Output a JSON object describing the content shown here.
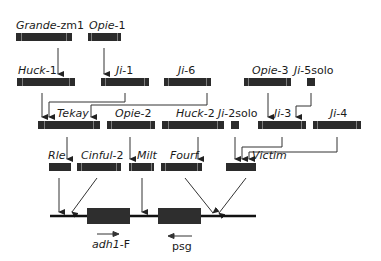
{
  "diagram": {
    "type": "transposon nesting / insertion history",
    "colors": {
      "element_box": "#2b2b2b",
      "lines": "#333333",
      "background": "#ffffff"
    },
    "rows": [
      {
        "level": 1,
        "elements": [
          {
            "id": "grande",
            "name_italic": "Grande",
            "name_suffix": "-zm1",
            "x": 16,
            "y": 33,
            "w": 56
          },
          {
            "id": "opie1",
            "name_italic": "Opie",
            "name_suffix": "-1",
            "x": 88,
            "y": 33,
            "w": 33
          }
        ]
      },
      {
        "level": 2,
        "elements": [
          {
            "id": "huck1",
            "name_italic": "Huck",
            "name_suffix": "-1",
            "x": 17,
            "y": 78,
            "w": 58
          },
          {
            "id": "ji1",
            "name_italic": "Ji",
            "name_suffix": "-1",
            "x": 101,
            "y": 78,
            "w": 48
          },
          {
            "id": "ji6",
            "name_italic": "Ji",
            "name_suffix": "-6",
            "x": 164,
            "y": 78,
            "w": 47
          },
          {
            "id": "opie3",
            "name_italic": "Opie",
            "name_suffix": "-3",
            "x": 244,
            "y": 78,
            "w": 47
          },
          {
            "id": "ji5solo",
            "name_italic": "Ji",
            "name_suffix": "-5solo",
            "x": 307,
            "y": 78,
            "w": 8,
            "solo": true
          }
        ]
      },
      {
        "level": 3,
        "elements": [
          {
            "id": "tekay",
            "name_italic": "Tekay",
            "name_suffix": "",
            "x": 38,
            "y": 121,
            "w": 62
          },
          {
            "id": "opie2",
            "name_italic": "Opie",
            "name_suffix": "-2",
            "x": 107,
            "y": 121,
            "w": 48
          },
          {
            "id": "huck2",
            "name_italic": "Huck",
            "name_suffix": "-2",
            "x": 162,
            "y": 121,
            "w": 62
          },
          {
            "id": "ji2solo",
            "name_italic": "Ji",
            "name_suffix": "-2solo",
            "x": 231,
            "y": 121,
            "w": 8,
            "solo": true
          },
          {
            "id": "ji3",
            "name_italic": "Ji",
            "name_suffix": "-3",
            "x": 258,
            "y": 121,
            "w": 48
          },
          {
            "id": "ji4",
            "name_italic": "Ji",
            "name_suffix": "-4",
            "x": 313,
            "y": 121,
            "w": 48
          }
        ]
      },
      {
        "level": 4,
        "elements": [
          {
            "id": "rle",
            "name_italic": "Rle",
            "name_suffix": "",
            "x": 49,
            "y": 163,
            "w": 22
          },
          {
            "id": "cinful2",
            "name_italic": "Cinful",
            "name_suffix": "-2",
            "x": 77,
            "y": 163,
            "w": 44
          },
          {
            "id": "milt",
            "name_italic": "Milt",
            "name_suffix": "",
            "x": 129,
            "y": 163,
            "w": 25
          },
          {
            "id": "fourf",
            "name_italic": "Fourf",
            "name_suffix": "",
            "x": 161,
            "y": 163,
            "w": 41
          },
          {
            "id": "victim",
            "name_italic": "Victim",
            "name_suffix": "",
            "x": 226,
            "y": 163,
            "w": 30
          }
        ]
      }
    ],
    "locus": {
      "line": {
        "x1": 50,
        "x2": 256,
        "y": 216
      },
      "genes": [
        {
          "id": "adh1f",
          "label_italic": "adh1",
          "label_suffix": "-F",
          "x": 87,
          "w": 43,
          "direction": "right"
        },
        {
          "id": "psg",
          "label_italic": "",
          "label_suffix": "psg",
          "x": 158,
          "w": 43,
          "direction": "left"
        }
      ]
    },
    "insertions": [
      {
        "from": "grande",
        "into": "huck1"
      },
      {
        "from": "opie1",
        "into": "ji1"
      },
      {
        "from": "huck1",
        "into": "tekay"
      },
      {
        "from": "ji1",
        "into": "tekay"
      },
      {
        "from": "ji6",
        "into": "tekay"
      },
      {
        "from": "opie3",
        "into": "ji3"
      },
      {
        "from": "ji5solo",
        "into": "ji3"
      },
      {
        "from": "tekay",
        "into": "rle"
      },
      {
        "from": "opie2",
        "into": "milt"
      },
      {
        "from": "huck2",
        "into": "fourf"
      },
      {
        "from": "ji2solo",
        "into": "victim"
      },
      {
        "from": "ji3",
        "into": "victim"
      },
      {
        "from": "ji4",
        "into": "victim"
      },
      {
        "from": "rle",
        "into": "locus"
      },
      {
        "from": "cinful2",
        "into": "locus"
      },
      {
        "from": "milt",
        "into": "locus"
      },
      {
        "from": "fourf",
        "into": "locus"
      },
      {
        "from": "victim",
        "into": "locus"
      }
    ]
  }
}
